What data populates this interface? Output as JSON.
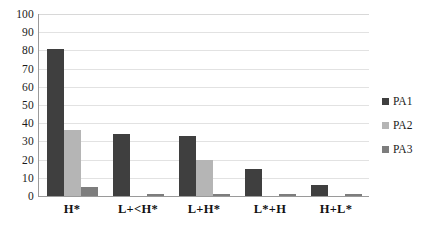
{
  "chart_data": {
    "type": "bar",
    "title": "",
    "subtitle": "",
    "xlabel": "",
    "ylabel": "",
    "ylim": [
      0,
      100
    ],
    "ytick_step": 10,
    "yticks": [
      100,
      90,
      80,
      70,
      60,
      50,
      40,
      30,
      20,
      10,
      0
    ],
    "grid": true,
    "grid_axis": "y",
    "legend_position": "right",
    "categories": [
      "H*",
      "L+<H*",
      "L+H*",
      "L*+H",
      "H+L*"
    ],
    "series": [
      {
        "name": "PA1",
        "color": "#3f3f3f",
        "values": [
          81,
          34,
          33,
          15,
          6
        ]
      },
      {
        "name": "PA2",
        "color": "#b5b5b5",
        "values": [
          36,
          0,
          20,
          0,
          0
        ]
      },
      {
        "name": "PA3",
        "color": "#7d7d7d",
        "values": [
          5,
          1,
          1,
          1,
          1
        ]
      }
    ]
  },
  "axis": {
    "y": {
      "ticks": [
        "100",
        "90",
        "80",
        "70",
        "60",
        "50",
        "40",
        "30",
        "20",
        "10",
        "0"
      ]
    },
    "x": {
      "ticks": [
        "H*",
        "L+<H*",
        "L+H*",
        "L*+H",
        "H+L*"
      ]
    }
  },
  "legend": {
    "items": [
      {
        "label": "PA1",
        "color": "#3f3f3f",
        "swatch": "square-swatch-icon"
      },
      {
        "label": "PA2",
        "color": "#b5b5b5",
        "swatch": "square-swatch-icon"
      },
      {
        "label": "PA3",
        "color": "#7d7d7d",
        "swatch": "square-swatch-icon"
      }
    ]
  }
}
